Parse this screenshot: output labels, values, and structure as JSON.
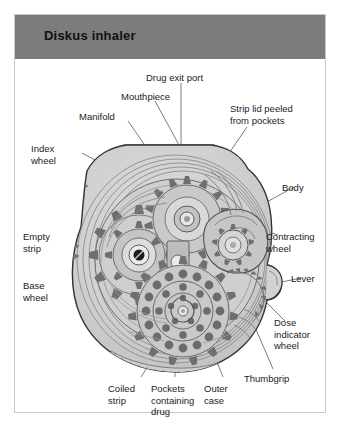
{
  "panel": {
    "title": "Diskus inhaler",
    "header_color": "#7c7c7c",
    "border_color": "#c9c9c9",
    "background_color": "#ffffff"
  },
  "figure": {
    "type": "cutaway-illustration",
    "style": "grayscale line drawing",
    "palette": {
      "outline": "#3a3a3a",
      "body_fill": "#d2d2d2",
      "gear_fill": "#b3b3b3",
      "gear_tooth": "#6f6f6f",
      "light_fill": "#e4e4e4",
      "leader_line": "#555555"
    },
    "labels": [
      {
        "id": "drug-exit-port",
        "text": "Drug exit port",
        "x": 131,
        "y": 57,
        "align": "left"
      },
      {
        "id": "mouthpiece",
        "text": "Mouthpiece",
        "x": 106,
        "y": 76,
        "align": "left"
      },
      {
        "id": "strip-lid-peeled",
        "text": "Strip lid peeled\nfrom pockets",
        "x": 229,
        "y": 88,
        "align": "left"
      },
      {
        "id": "manifold",
        "text": "Manifold",
        "x": 78,
        "y": 96,
        "align": "left"
      },
      {
        "id": "index-wheel",
        "text": "Index\nwheel",
        "x": 30,
        "y": 128,
        "align": "left"
      },
      {
        "id": "body",
        "text": "Body",
        "x": 281,
        "y": 167,
        "align": "left"
      },
      {
        "id": "empty-strip",
        "text": "Empty\nstrip",
        "x": 22,
        "y": 216,
        "align": "left"
      },
      {
        "id": "contracting-wheel",
        "text": "Contracting\nwheel",
        "x": 265,
        "y": 216,
        "align": "left"
      },
      {
        "id": "base-wheel",
        "text": "Base\nwheel",
        "x": 22,
        "y": 265,
        "align": "left"
      },
      {
        "id": "lever",
        "text": "Lever",
        "x": 290,
        "y": 262,
        "align": "left"
      },
      {
        "id": "dose-indicator-wheel",
        "text": "Dose\nindicator\nwheel",
        "x": 273,
        "y": 302,
        "align": "left"
      },
      {
        "id": "thumbgrip",
        "text": "Thumbgrip",
        "x": 243,
        "y": 358,
        "align": "left"
      },
      {
        "id": "coiled-strip",
        "text": "Coiled\nstrip",
        "x": 107,
        "y": 368,
        "align": "left"
      },
      {
        "id": "pockets-containing-drug",
        "text": "Pockets\ncontaining\ndrug",
        "x": 150,
        "y": 368,
        "align": "left"
      },
      {
        "id": "outer-case",
        "text": "Outer\ncase",
        "x": 203,
        "y": 368,
        "align": "left"
      }
    ],
    "parts_named": [
      "Drug exit port",
      "Mouthpiece",
      "Manifold",
      "Strip lid peeled from pockets",
      "Index wheel",
      "Body",
      "Empty strip",
      "Contracting wheel",
      "Base wheel",
      "Lever",
      "Dose indicator wheel",
      "Thumbgrip",
      "Coiled strip",
      "Pockets containing drug",
      "Outer case"
    ]
  }
}
